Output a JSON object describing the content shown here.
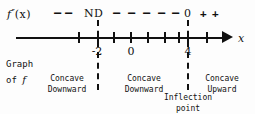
{
  "figure": {
    "type": "sign-chart-number-line",
    "function_label": {
      "base": "f",
      "prime": "″",
      "arg": "(x)",
      "full": "f″(x)"
    },
    "axis": {
      "variable_label": "x",
      "tick_values": [
        "",
        "-2",
        "",
        "0",
        "",
        "",
        "",
        "4",
        ""
      ],
      "labeled_ticks": [
        {
          "value": "-2",
          "x": 97
        },
        {
          "value": "0",
          "x": 130
        },
        {
          "value": "4",
          "x": 187
        }
      ],
      "arrow_direction": "right"
    },
    "sign_row": [
      {
        "name": "minus-left-1",
        "text": "–",
        "x": 54
      },
      {
        "name": "minus-left-2",
        "text": "–",
        "x": 65
      },
      {
        "name": "nd-marker",
        "text": "ND",
        "x": 90
      },
      {
        "name": "minus-mid-1",
        "text": "–",
        "x": 113
      },
      {
        "name": "minus-mid-2",
        "text": "–",
        "x": 128
      },
      {
        "name": "minus-mid-3",
        "text": "–",
        "x": 143
      },
      {
        "name": "minus-mid-4",
        "text": "–",
        "x": 158
      },
      {
        "name": "minus-mid-5",
        "text": "–",
        "x": 172
      },
      {
        "name": "zero-marker",
        "text": "0",
        "x": 184
      },
      {
        "name": "plus-right-1",
        "text": "+",
        "x": 200
      },
      {
        "name": "plus-right-2",
        "text": "+",
        "x": 212
      }
    ],
    "critical_points": [
      {
        "label": "ND",
        "x_value": "-2",
        "pixel_x": 97
      },
      {
        "label": "0",
        "x_value": "4",
        "pixel_x": 187
      }
    ],
    "graph_of_caption": {
      "line1": "Graph",
      "line2_prefix": "of",
      "line2_italic": "f"
    },
    "regions": [
      {
        "name": "region-left",
        "line1": "Concave",
        "line2": "Downward",
        "interval": "x < -2"
      },
      {
        "name": "region-middle",
        "line1": "Concave",
        "line2": "Downward",
        "interval": "-2 < x < 4"
      },
      {
        "name": "region-right",
        "line1": "Concave",
        "line2": "Upward",
        "interval": "x > 4"
      }
    ],
    "inflection": {
      "line1": "Inflection",
      "line2": "point"
    },
    "colors": {
      "ink": "#111111",
      "background": "#fdfdfd"
    }
  }
}
